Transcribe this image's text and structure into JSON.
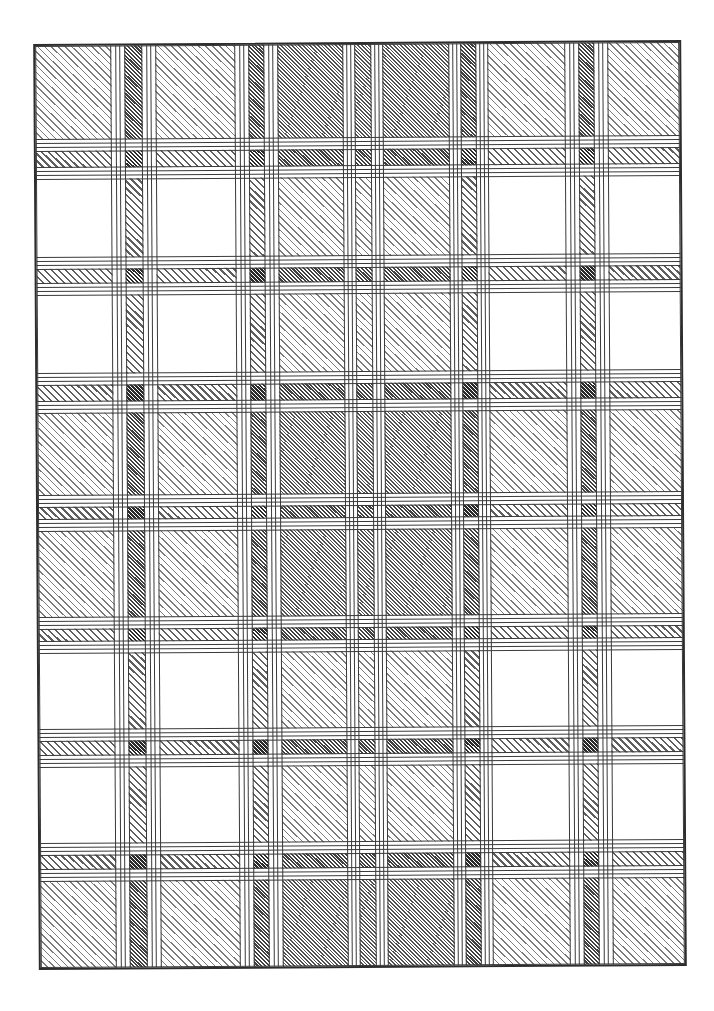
{
  "figure": {
    "type": "plaid-check-pattern-diagram",
    "canvas": {
      "width": 714,
      "height": 1011
    },
    "frame": {
      "x": 36,
      "y": 42,
      "width": 648,
      "height": 926,
      "border_color": "#2d2d2d"
    },
    "colors": {
      "background": "#ffffff",
      "outline_ink": "#3a3a3a",
      "hatch_ink": "#444444"
    },
    "tones": {
      "W": 0,
      "L": 1,
      "M": 1.5
    },
    "hatch_class_by_density": {
      "1": "d10",
      "1.5": "d15",
      "2": "d20",
      "2.5": "d25",
      "3": "d30"
    },
    "legend": {
      "W": "white band (outlined, no hatch)",
      "L": "light fine diagonal hatch band",
      "M": "bold medium diagonal hatch stripe",
      "S": "thin white pin-stripe band (outlined)",
      "G": "plain white gap between bands"
    },
    "columns": [
      [
        76,
        "W"
      ],
      [
        4,
        "G"
      ],
      [
        5,
        "S"
      ],
      [
        4,
        "G"
      ],
      [
        18,
        "M"
      ],
      [
        4,
        "G"
      ],
      [
        5,
        "S"
      ],
      [
        4,
        "G"
      ],
      [
        80,
        "W"
      ],
      [
        4,
        "G"
      ],
      [
        5,
        "S"
      ],
      [
        4,
        "G"
      ],
      [
        16,
        "M"
      ],
      [
        4,
        "G"
      ],
      [
        5,
        "S"
      ],
      [
        4,
        "G"
      ],
      [
        66,
        "L"
      ],
      [
        3,
        "G"
      ],
      [
        5,
        "S"
      ],
      [
        3,
        "G"
      ],
      [
        17,
        "L"
      ],
      [
        3,
        "G"
      ],
      [
        5,
        "S"
      ],
      [
        3,
        "G"
      ],
      [
        67,
        "L"
      ],
      [
        3,
        "G"
      ],
      [
        5,
        "S"
      ],
      [
        3,
        "G"
      ],
      [
        16,
        "M"
      ],
      [
        3,
        "G"
      ],
      [
        5,
        "S"
      ],
      [
        3,
        "G"
      ],
      [
        78,
        "W"
      ],
      [
        4,
        "G"
      ],
      [
        5,
        "S"
      ],
      [
        4,
        "G"
      ],
      [
        16,
        "M"
      ],
      [
        4,
        "G"
      ],
      [
        5,
        "S"
      ],
      [
        4,
        "G"
      ],
      [
        72,
        "W"
      ]
    ],
    "rows": [
      [
        94,
        "L"
      ],
      [
        3,
        "G"
      ],
      [
        5,
        "S"
      ],
      [
        3,
        "G"
      ],
      [
        17,
        "M"
      ],
      [
        3,
        "G"
      ],
      [
        5,
        "S"
      ],
      [
        3,
        "G"
      ],
      [
        79,
        "W"
      ],
      [
        3,
        "G"
      ],
      [
        5,
        "S"
      ],
      [
        3,
        "G"
      ],
      [
        15,
        "M"
      ],
      [
        3,
        "G"
      ],
      [
        5,
        "S"
      ],
      [
        3,
        "G"
      ],
      [
        79,
        "W"
      ],
      [
        3,
        "G"
      ],
      [
        5,
        "S"
      ],
      [
        3,
        "G"
      ],
      [
        17,
        "M"
      ],
      [
        3,
        "G"
      ],
      [
        5,
        "S"
      ],
      [
        3,
        "G"
      ],
      [
        83,
        "L"
      ],
      [
        3,
        "G"
      ],
      [
        5,
        "S"
      ],
      [
        3,
        "G"
      ],
      [
        13,
        "M"
      ],
      [
        3,
        "G"
      ],
      [
        5,
        "S"
      ],
      [
        3,
        "G"
      ],
      [
        87,
        "L"
      ],
      [
        3,
        "G"
      ],
      [
        5,
        "S"
      ],
      [
        3,
        "G"
      ],
      [
        13,
        "M"
      ],
      [
        3,
        "G"
      ],
      [
        5,
        "S"
      ],
      [
        3,
        "G"
      ],
      [
        77,
        "W"
      ],
      [
        3,
        "G"
      ],
      [
        5,
        "S"
      ],
      [
        3,
        "G"
      ],
      [
        15,
        "M"
      ],
      [
        3,
        "G"
      ],
      [
        5,
        "S"
      ],
      [
        3,
        "G"
      ],
      [
        77,
        "W"
      ],
      [
        3,
        "G"
      ],
      [
        5,
        "S"
      ],
      [
        3,
        "G"
      ],
      [
        15,
        "M"
      ],
      [
        3,
        "G"
      ],
      [
        5,
        "S"
      ],
      [
        3,
        "G"
      ],
      [
        87,
        "L"
      ]
    ]
  }
}
